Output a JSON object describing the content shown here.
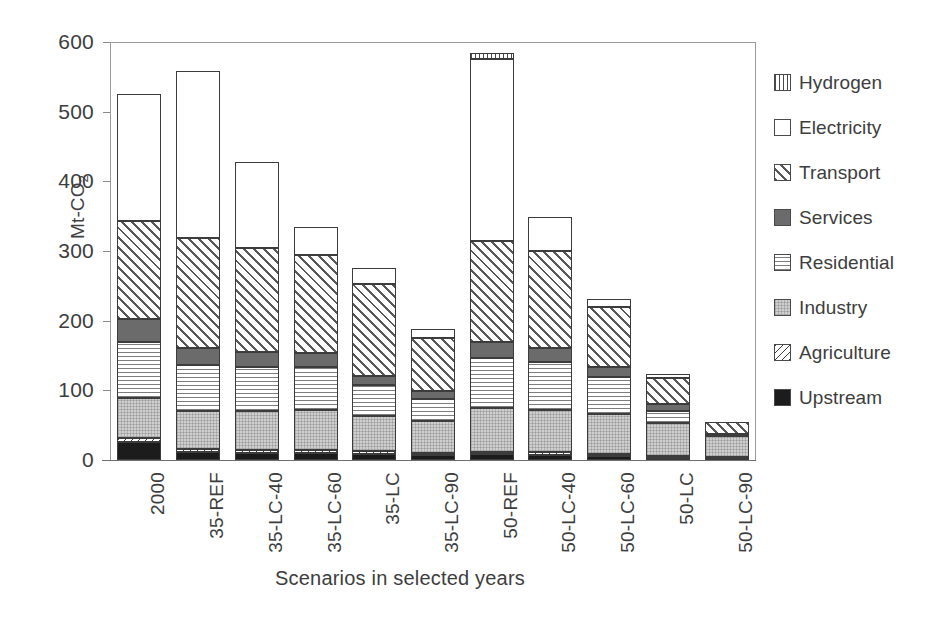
{
  "chart_data": {
    "type": "bar",
    "bar_mode": "stacked",
    "title": "",
    "xlabel": "Scenarios in selected years",
    "ylabel": "Mt-CO2",
    "ylabel_display": "Mt-CO",
    "ylabel_sub": "2",
    "ylim": [
      0,
      600
    ],
    "ytick_values": [
      0,
      100,
      200,
      300,
      400,
      500,
      600
    ],
    "ytick_labels": [
      "0",
      "100",
      "200",
      "300",
      "400",
      "500",
      "600"
    ],
    "grid": false,
    "legend_position": "right",
    "categories": [
      "2000",
      "35-REF",
      "35-LC-40",
      "35-LC-60",
      "35-LC",
      "35-LC-90",
      "50-REF",
      "50-LC-40",
      "50-LC-60",
      "50-LC",
      "50-LC-90"
    ],
    "series": [
      {
        "name": "Upstream",
        "pattern": "solid-black",
        "color": "#1c1c1c",
        "values": [
          26,
          12,
          10,
          10,
          9,
          7,
          8,
          7,
          6,
          3,
          1
        ]
      },
      {
        "name": "Agriculture",
        "pattern": "diagonal-back-hatch",
        "color": "#ffffff",
        "values": [
          5,
          4,
          4,
          4,
          4,
          3,
          4,
          4,
          3,
          3,
          3
        ]
      },
      {
        "name": "Industry",
        "pattern": "light-gray-dots",
        "color": "#cfcfcf",
        "values": [
          58,
          55,
          57,
          58,
          50,
          46,
          63,
          61,
          57,
          47,
          31
        ]
      },
      {
        "name": "Residential",
        "pattern": "horizontal-lines",
        "color": "#ffffff",
        "values": [
          80,
          66,
          63,
          61,
          44,
          31,
          72,
          68,
          53,
          18,
          0
        ]
      },
      {
        "name": "Services",
        "pattern": "solid-dark-gray",
        "color": "#6b6b6b",
        "values": [
          34,
          24,
          21,
          21,
          14,
          12,
          23,
          21,
          14,
          9,
          3
        ]
      },
      {
        "name": "Transport",
        "pattern": "diagonal-hatch",
        "color": "#ffffff",
        "values": [
          140,
          157,
          149,
          140,
          131,
          76,
          144,
          139,
          87,
          38,
          16
        ]
      },
      {
        "name": "Electricity",
        "pattern": "white",
        "color": "#ffffff",
        "values": [
          183,
          240,
          124,
          41,
          23,
          13,
          262,
          49,
          11,
          6,
          0
        ]
      },
      {
        "name": "Hydrogen",
        "pattern": "vertical-lines",
        "color": "#ffffff",
        "values": [
          0,
          0,
          0,
          0,
          0,
          0,
          8,
          0,
          0,
          0,
          0
        ]
      }
    ],
    "totals": [
      526,
      558,
      428,
      335,
      275,
      188,
      584,
      349,
      231,
      124,
      54
    ]
  },
  "legend": {
    "entries": [
      {
        "label": "Hydrogen",
        "pattern": "vertical-lines"
      },
      {
        "label": "Electricity",
        "pattern": "white"
      },
      {
        "label": "Transport",
        "pattern": "diagonal-hatch"
      },
      {
        "label": "Services",
        "pattern": "solid-dark-gray"
      },
      {
        "label": "Residential",
        "pattern": "horizontal-lines"
      },
      {
        "label": "Industry",
        "pattern": "light-gray-dots"
      },
      {
        "label": "Agriculture",
        "pattern": "diagonal-back-hatch"
      },
      {
        "label": "Upstream",
        "pattern": "solid-black"
      }
    ]
  }
}
